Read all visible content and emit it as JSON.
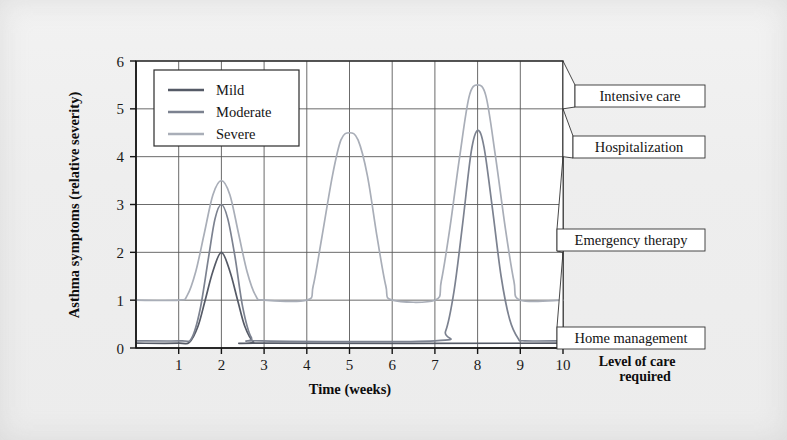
{
  "chart_data": {
    "type": "line",
    "title": "",
    "xlabel": "Time (weeks)",
    "ylabel": "Asthma symptoms (relative severity)",
    "xlim": [
      0,
      10
    ],
    "ylim": [
      0,
      6
    ],
    "grid": true,
    "xticks": [
      "1",
      "2",
      "3",
      "4",
      "5",
      "6",
      "7",
      "8",
      "9",
      "10"
    ],
    "yticks": [
      "0",
      "1",
      "2",
      "3",
      "4",
      "5",
      "6"
    ],
    "legend_position": "upper-left-inside",
    "series": [
      {
        "name": "Mild",
        "color": "#555a66",
        "baseline": 0.1,
        "peaks": [
          {
            "week": 2,
            "value": 2.0,
            "width": 0.62
          }
        ],
        "points": [
          {
            "x": 0.0,
            "y": 0.1
          },
          {
            "x": 1.0,
            "y": 0.1
          },
          {
            "x": 1.25,
            "y": 0.12
          },
          {
            "x": 1.45,
            "y": 0.45
          },
          {
            "x": 1.62,
            "y": 1.0
          },
          {
            "x": 1.8,
            "y": 1.6
          },
          {
            "x": 2.0,
            "y": 2.0
          },
          {
            "x": 2.2,
            "y": 1.6
          },
          {
            "x": 2.38,
            "y": 1.0
          },
          {
            "x": 2.55,
            "y": 0.45
          },
          {
            "x": 2.75,
            "y": 0.13
          },
          {
            "x": 3.0,
            "y": 0.1
          },
          {
            "x": 10.0,
            "y": 0.1
          }
        ]
      },
      {
        "name": "Moderate",
        "color": "#7c8290",
        "baseline": 0.15,
        "peaks": [
          {
            "week": 2,
            "value": 3.0,
            "width": 0.58
          },
          {
            "week": 8,
            "value": 4.55,
            "width": 0.7
          }
        ],
        "points": [
          {
            "x": 0.0,
            "y": 0.15
          },
          {
            "x": 1.05,
            "y": 0.15
          },
          {
            "x": 1.3,
            "y": 0.2
          },
          {
            "x": 1.5,
            "y": 0.8
          },
          {
            "x": 1.7,
            "y": 1.9
          },
          {
            "x": 1.85,
            "y": 2.7
          },
          {
            "x": 2.0,
            "y": 3.0
          },
          {
            "x": 2.15,
            "y": 2.7
          },
          {
            "x": 2.32,
            "y": 1.9
          },
          {
            "x": 2.5,
            "y": 0.85
          },
          {
            "x": 2.7,
            "y": 0.22
          },
          {
            "x": 2.95,
            "y": 0.15
          },
          {
            "x": 7.0,
            "y": 0.15
          },
          {
            "x": 7.25,
            "y": 0.35
          },
          {
            "x": 7.45,
            "y": 1.2
          },
          {
            "x": 7.65,
            "y": 2.6
          },
          {
            "x": 7.85,
            "y": 4.1
          },
          {
            "x": 8.0,
            "y": 4.55
          },
          {
            "x": 8.15,
            "y": 4.2
          },
          {
            "x": 8.35,
            "y": 2.9
          },
          {
            "x": 8.55,
            "y": 1.5
          },
          {
            "x": 8.75,
            "y": 0.6
          },
          {
            "x": 8.95,
            "y": 0.2
          },
          {
            "x": 9.1,
            "y": 0.15
          },
          {
            "x": 10.0,
            "y": 0.15
          }
        ]
      },
      {
        "name": "Severe",
        "color": "#a9aeb8",
        "baseline": 1.0,
        "peaks": [
          {
            "week": 2,
            "value": 3.5,
            "width": 0.75
          },
          {
            "week": 5,
            "value": 4.5,
            "width": 0.8
          },
          {
            "week": 8,
            "value": 5.5,
            "width": 0.85
          }
        ],
        "points": [
          {
            "x": 0.0,
            "y": 1.0
          },
          {
            "x": 1.0,
            "y": 1.0
          },
          {
            "x": 1.2,
            "y": 1.1
          },
          {
            "x": 1.4,
            "y": 1.6
          },
          {
            "x": 1.6,
            "y": 2.4
          },
          {
            "x": 1.8,
            "y": 3.2
          },
          {
            "x": 2.0,
            "y": 3.5
          },
          {
            "x": 2.2,
            "y": 3.2
          },
          {
            "x": 2.4,
            "y": 2.4
          },
          {
            "x": 2.6,
            "y": 1.6
          },
          {
            "x": 2.8,
            "y": 1.1
          },
          {
            "x": 3.0,
            "y": 1.0
          },
          {
            "x": 4.0,
            "y": 1.0
          },
          {
            "x": 4.15,
            "y": 1.3
          },
          {
            "x": 4.35,
            "y": 2.3
          },
          {
            "x": 4.6,
            "y": 3.6
          },
          {
            "x": 4.8,
            "y": 4.35
          },
          {
            "x": 5.0,
            "y": 4.5
          },
          {
            "x": 5.2,
            "y": 4.35
          },
          {
            "x": 5.42,
            "y": 3.6
          },
          {
            "x": 5.65,
            "y": 2.3
          },
          {
            "x": 5.85,
            "y": 1.3
          },
          {
            "x": 6.0,
            "y": 1.0
          },
          {
            "x": 7.0,
            "y": 1.0
          },
          {
            "x": 7.15,
            "y": 1.4
          },
          {
            "x": 7.35,
            "y": 2.5
          },
          {
            "x": 7.58,
            "y": 4.0
          },
          {
            "x": 7.8,
            "y": 5.25
          },
          {
            "x": 8.0,
            "y": 5.5
          },
          {
            "x": 8.2,
            "y": 5.25
          },
          {
            "x": 8.42,
            "y": 4.0
          },
          {
            "x": 8.65,
            "y": 2.5
          },
          {
            "x": 8.85,
            "y": 1.4
          },
          {
            "x": 9.0,
            "y": 1.0
          },
          {
            "x": 10.0,
            "y": 1.0
          }
        ]
      }
    ]
  },
  "legend": {
    "items": [
      {
        "label": "Mild",
        "color": "#555a66"
      },
      {
        "label": "Moderate",
        "color": "#7c8290"
      },
      {
        "label": "Severe",
        "color": "#a9aeb8"
      }
    ]
  },
  "callouts": {
    "title_line1": "Level of care",
    "title_line2": "required",
    "items": [
      {
        "label": "Intensive care",
        "level": 5.0
      },
      {
        "label": "Hospitalization",
        "level": 4.0
      },
      {
        "label": "Emergency therapy",
        "level": 2.0
      },
      {
        "label": "Home management",
        "level": 0.2
      }
    ]
  },
  "colors": {
    "background": "#eeeeee",
    "plot_background": "#ffffff",
    "grid": "#5a5a5a",
    "axis": "#111111",
    "text": "#111111"
  }
}
